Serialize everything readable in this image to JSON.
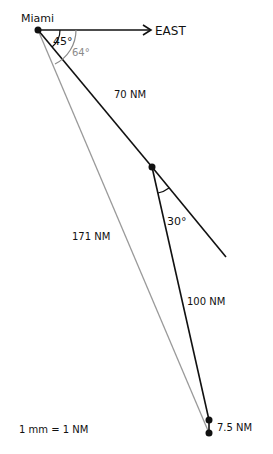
{
  "diagram": {
    "origin_label": "Miami",
    "direction_label": "EAST",
    "angles": {
      "heading_1": "45°",
      "resultant_bearing": "64°",
      "turn": "30°"
    },
    "legs": {
      "leg_1": "70 NM",
      "leg_2": "100 NM",
      "resultant": "171 NM",
      "error": "7.5 NM"
    },
    "scale": "1 mm = 1 NM",
    "colors": {
      "ink": "#111111",
      "resultant_line": "#9a9a9a",
      "annotation_gray": "#8a8a8a",
      "background": "#ffffff"
    }
  }
}
